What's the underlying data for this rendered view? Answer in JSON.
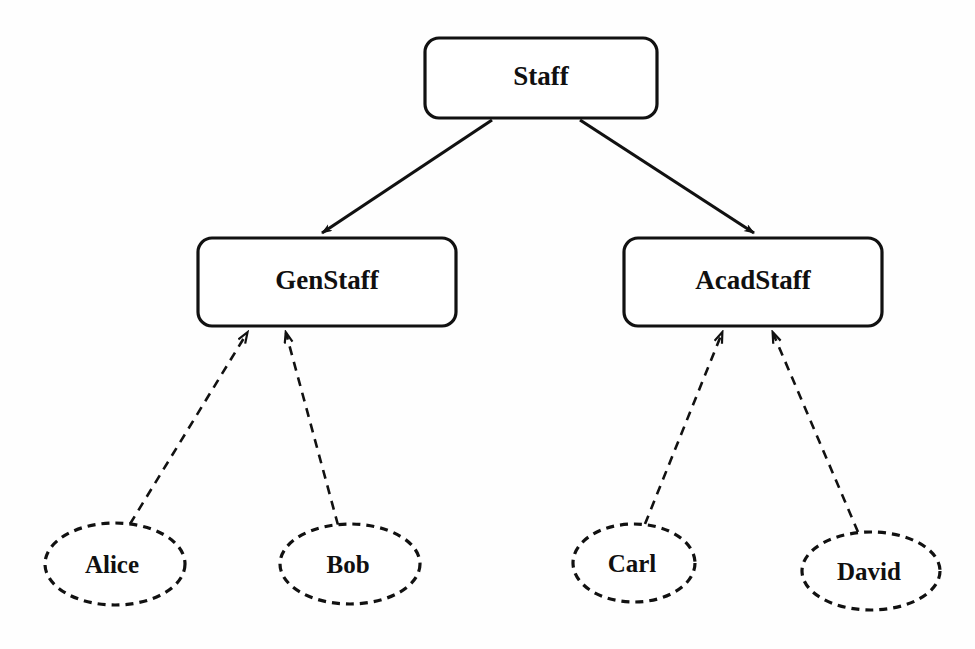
{
  "diagram": {
    "type": "class-instance-hierarchy",
    "background_color": "#fefefe",
    "line_color": "#111111",
    "classes": [
      {
        "id": "staff",
        "label": "Staff",
        "shape": "rounded-rectangle",
        "line_style": "solid",
        "x": 425,
        "y": 38,
        "width": 232,
        "height": 80
      },
      {
        "id": "genstaff",
        "label": "GenStaff",
        "shape": "rounded-rectangle",
        "line_style": "solid",
        "x": 198,
        "y": 238,
        "width": 258,
        "height": 88
      },
      {
        "id": "acadstaff",
        "label": "AcadStaff",
        "shape": "rounded-rectangle",
        "line_style": "solid",
        "x": 624,
        "y": 238,
        "width": 258,
        "height": 88
      }
    ],
    "instances": [
      {
        "id": "alice",
        "label": "Alice",
        "shape": "ellipse",
        "line_style": "dashed",
        "cx": 115,
        "cy": 564,
        "rx": 70,
        "ry": 41
      },
      {
        "id": "bob",
        "label": "Bob",
        "shape": "ellipse",
        "line_style": "dashed",
        "cx": 350,
        "cy": 564,
        "rx": 70,
        "ry": 40
      },
      {
        "id": "carl",
        "label": "Carl",
        "shape": "ellipse",
        "line_style": "dashed",
        "cx": 634,
        "cy": 563,
        "rx": 61,
        "ry": 39
      },
      {
        "id": "david",
        "label": "David",
        "shape": "ellipse",
        "line_style": "dashed",
        "cx": 871,
        "cy": 571,
        "rx": 69,
        "ry": 39
      }
    ],
    "isa_edges": [
      {
        "from": "staff",
        "to": "genstaff",
        "line_style": "solid",
        "arrowhead": "filled",
        "x1": 492,
        "y1": 120,
        "x2": 319,
        "y2": 236
      },
      {
        "from": "staff",
        "to": "acadstaff",
        "line_style": "solid",
        "arrowhead": "filled",
        "x1": 580,
        "y1": 120,
        "x2": 757,
        "y2": 236
      }
    ],
    "instanceof_edges": [
      {
        "from": "alice",
        "to": "genstaff",
        "line_style": "dashed",
        "arrowhead": "open",
        "x1": 130,
        "y1": 524,
        "x2": 249,
        "y2": 329
      },
      {
        "from": "bob",
        "to": "genstaff",
        "line_style": "dashed",
        "arrowhead": "open",
        "x1": 338,
        "y1": 525,
        "x2": 285,
        "y2": 329
      },
      {
        "from": "carl",
        "to": "acadstaff",
        "line_style": "dashed",
        "arrowhead": "open",
        "x1": 645,
        "y1": 524,
        "x2": 724,
        "y2": 329
      },
      {
        "from": "david",
        "to": "acadstaff",
        "line_style": "dashed",
        "arrowhead": "open",
        "x1": 858,
        "y1": 532,
        "x2": 771,
        "y2": 329
      }
    ]
  }
}
